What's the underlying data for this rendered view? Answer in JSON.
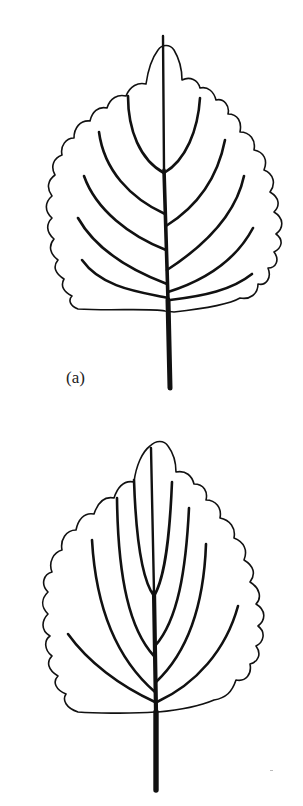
{
  "figure": {
    "panels": [
      {
        "id": "a",
        "label": "(a)",
        "venation": "pinnate",
        "secondary_veins_left": 5,
        "secondary_veins_right": 5,
        "margin": "crenate"
      },
      {
        "id": "b",
        "label": "(b)",
        "venation": "acrodromous/palmate-like",
        "secondary_veins_left": 4,
        "secondary_veins_right": 4,
        "margin": "crenate"
      }
    ]
  },
  "colors": {
    "stroke": "#111111",
    "background": "#ffffff"
  }
}
